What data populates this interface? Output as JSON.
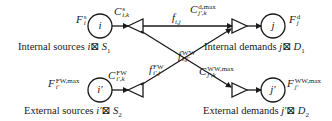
{
  "diagram": {
    "type": "network-superstructure",
    "nodes": {
      "internal_source": {
        "symbol": "i",
        "flow_label_main": "F",
        "flow_label_sup": "s",
        "flow_label_sub": "i"
      },
      "external_source": {
        "symbol": "i′",
        "flow_label_main": "F",
        "flow_label_sup": "FW,max",
        "flow_label_sub": "i′"
      },
      "internal_demand": {
        "symbol": "j",
        "flow_label_main": "F",
        "flow_label_sup": "d",
        "flow_label_sub": "j"
      },
      "external_demand": {
        "symbol": "j′",
        "flow_label_main": "F",
        "flow_label_sup": "WW,max",
        "flow_label_sub": "j′"
      }
    },
    "concentrations": {
      "internal_source": {
        "main": "C",
        "sup": "s",
        "sub": "i,k"
      },
      "external_source": {
        "main": "C",
        "sup": "FW",
        "sub": "i′,k"
      },
      "internal_demand": {
        "main": "C",
        "sup": "d,max",
        "sub": "j′,k"
      },
      "external_demand": {
        "main": "C",
        "sup": "WW,max",
        "sub": "j′,k"
      }
    },
    "flows": {
      "source_to_demand": {
        "main": "f",
        "sup": "",
        "sub": "i,j"
      },
      "external_source_to_demand": {
        "main": "f",
        "sup": "FW",
        "sub": "i′,j"
      },
      "source_to_external_demand": {
        "main": "f",
        "sup": "WW",
        "sub": "i,j′"
      }
    },
    "captions": {
      "internal_sources": {
        "text": "Internal sources ",
        "var": "i",
        "sym": "⊠",
        "set": "S",
        "set_sub": "1"
      },
      "external_sources": {
        "text": "External sources ",
        "var": "i′",
        "sym": "⊠",
        "set": "S",
        "set_sub": "2"
      },
      "internal_demands": {
        "text": "Internal demands ",
        "var": "j",
        "sym": "⊠",
        "set": "D",
        "set_sub": "1"
      },
      "external_demands": {
        "text": "External demands ",
        "var": "j′",
        "sym": "⊠",
        "set": "D",
        "set_sub": "2"
      }
    },
    "colors": {
      "stroke": "#1a1a1a",
      "background": "#ffffff"
    }
  }
}
